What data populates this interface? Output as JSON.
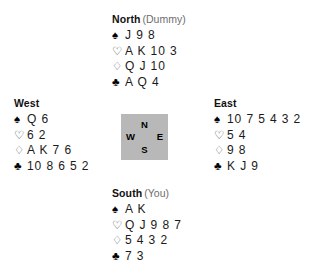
{
  "diagram": {
    "type": "bridge-hand-diagram",
    "background_color": "#ffffff",
    "suit_symbols": {
      "spade": "♠",
      "heart": "♡",
      "diamond": "♢",
      "club": "♣"
    },
    "compass": {
      "background_color": "#b8b8b8",
      "north": "N",
      "west": "W",
      "east": "E",
      "south": "S"
    },
    "hands": {
      "north": {
        "direction": "North",
        "role": "(Dummy)",
        "spades": "J 9 8",
        "hearts": "A K 10 3",
        "diamonds": "Q J 10",
        "clubs": "A Q 4"
      },
      "west": {
        "direction": "West",
        "role": "",
        "spades": "Q 6",
        "hearts": "6 2",
        "diamonds": "A K 7 6",
        "clubs": "10 8 6 5 2"
      },
      "east": {
        "direction": "East",
        "role": "",
        "spades": "10 7 5 4 3 2",
        "hearts": "5 4",
        "diamonds": "9 8",
        "clubs": "K J 9"
      },
      "south": {
        "direction": "South",
        "role": "(You)",
        "spades": "A K",
        "hearts": "Q J 9 8 7",
        "diamonds": "5 4 3 2",
        "clubs": "7 3"
      }
    }
  }
}
